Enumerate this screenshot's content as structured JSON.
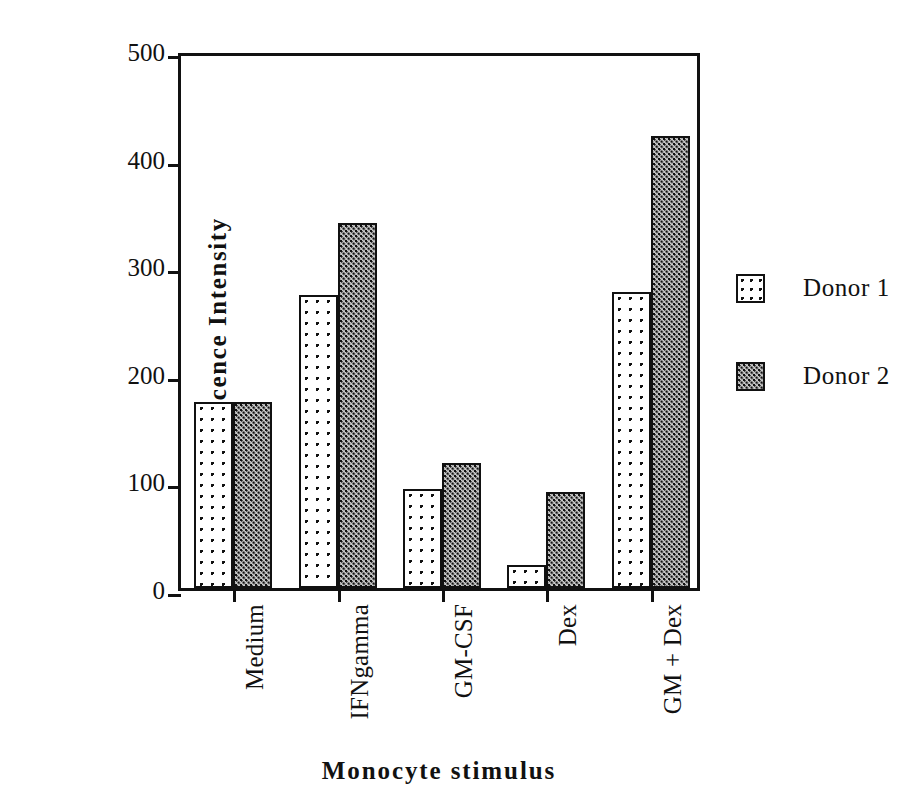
{
  "chart_data": {
    "type": "bar",
    "title": "",
    "xlabel": "Monocyte  stimulus",
    "ylabel": "Mean Fluorescence Intensity",
    "categories": [
      "Medium",
      "IFNgamma",
      "GM-CSF",
      "Dex",
      "GM + Dex"
    ],
    "series": [
      {
        "name": "Donor 1",
        "values": [
          173,
          272,
          92,
          21,
          275
        ]
      },
      {
        "name": "Donor 2",
        "values": [
          173,
          339,
          116,
          89,
          420
        ]
      }
    ],
    "ylim": [
      0,
      500
    ],
    "yticks": [
      0,
      100,
      200,
      300,
      400,
      500
    ],
    "ytick_labels": [
      "0",
      "100",
      "200",
      "300",
      "400",
      "500"
    ],
    "grid": false,
    "legend_position": "right",
    "legend_entries": [
      "Donor 1",
      "Donor 2"
    ],
    "colors": {
      "axis": "#111111",
      "donor1_fill": "#ffffff",
      "donor2_fill": "#c9c9c9",
      "outline": "#111111",
      "background": "#ffffff"
    }
  }
}
